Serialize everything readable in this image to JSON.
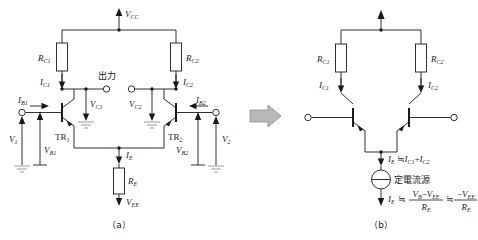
{
  "figure": {
    "title_a_caption": "（a）",
    "title_b_caption": "（b）",
    "transform_arrow": "right-block-arrow"
  },
  "circuit_a": {
    "supply_label": "V",
    "supply_sub": "CC",
    "resistors": [
      {
        "name": "R",
        "sub": "C1"
      },
      {
        "name": "R",
        "sub": "C2"
      },
      {
        "name": "R",
        "sub": "E"
      }
    ],
    "transistors": [
      {
        "name": "TR",
        "sub": "1"
      },
      {
        "name": "TR",
        "sub": "2"
      }
    ],
    "currents": [
      {
        "name": "I",
        "sub": "C1"
      },
      {
        "name": "I",
        "sub": "C2"
      },
      {
        "name": "I",
        "sub": "B1"
      },
      {
        "name": "I",
        "sub": "B2"
      },
      {
        "name": "I",
        "sub": "E"
      }
    ],
    "voltages": [
      {
        "name": "V",
        "sub": "C1"
      },
      {
        "name": "V",
        "sub": "C2"
      },
      {
        "name": "V",
        "sub": "B1"
      },
      {
        "name": "V",
        "sub": "B2"
      },
      {
        "name": "V",
        "sub": "1"
      },
      {
        "name": "V",
        "sub": "2"
      },
      {
        "name": "V",
        "sub": "EE"
      }
    ],
    "output_label": "出力"
  },
  "circuit_b": {
    "resistors": [
      {
        "name": "R",
        "sub": "C1"
      },
      {
        "name": "R",
        "sub": "C2"
      }
    ],
    "currents": [
      {
        "name": "I",
        "sub": "C1"
      },
      {
        "name": "I",
        "sub": "C2"
      }
    ],
    "source_label": "定電流源",
    "emitter_relation": {
      "lhs_name": "I",
      "lhs_sub": "E",
      "approx": "≒",
      "term1_name": "I",
      "term1_sub": "C1",
      "plus": "+",
      "term2_name": "I",
      "term2_sub": "C2"
    },
    "emitter_formula": {
      "lhs_name": "I",
      "lhs_sub": "E",
      "approx1": "≒",
      "num1_a_name": "V",
      "num1_a_sub": "B",
      "minus": "−",
      "num1_b_name": "V",
      "num1_b_sub": "EE",
      "den1_name": "R",
      "den1_sub": "E",
      "approx2": "≒",
      "num2_sign": "−",
      "num2_name": "V",
      "num2_sub": "EE",
      "den2_name": "R",
      "den2_sub": "E"
    }
  },
  "colors": {
    "wire": "#1a1a1a",
    "ground": "#9a9a9a",
    "arrow_fill": "#b8b8b8",
    "background": "#ffffff"
  }
}
